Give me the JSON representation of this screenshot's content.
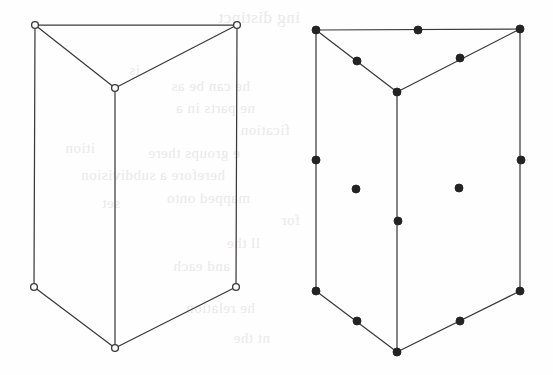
{
  "page": {
    "width": 553,
    "height": 375,
    "background_color": "#fefefe",
    "ink_color": "#3a3a3a",
    "bleedthrough_color": "#e9e7e6",
    "caption": ""
  },
  "figures": [
    {
      "id": "left-prism",
      "name": "triangular-prism-hollow-vertices",
      "marker_style": "hollow-circle",
      "marker_radius": 3.4,
      "marker_fill": "#fdfdfd",
      "marker_stroke": "#3a3a3a",
      "stroke_width": 1.25,
      "vertices": [
        {
          "label": "top-back-left",
          "x": 35,
          "y": 25
        },
        {
          "label": "top-back-right",
          "x": 237,
          "y": 25
        },
        {
          "label": "top-front",
          "x": 115,
          "y": 88
        },
        {
          "label": "bottom-back-left",
          "x": 34,
          "y": 287
        },
        {
          "label": "bottom-back-right",
          "x": 236,
          "y": 287
        },
        {
          "label": "bottom-front",
          "x": 115,
          "y": 348
        }
      ],
      "edges": [
        {
          "from": "top-back-left",
          "to": "top-back-right"
        },
        {
          "from": "top-back-left",
          "to": "top-front"
        },
        {
          "from": "top-back-right",
          "to": "top-front"
        },
        {
          "from": "top-back-left",
          "to": "bottom-back-left"
        },
        {
          "from": "top-back-right",
          "to": "bottom-back-right"
        },
        {
          "from": "top-front",
          "to": "bottom-front"
        },
        {
          "from": "bottom-back-left",
          "to": "bottom-front"
        },
        {
          "from": "bottom-back-right",
          "to": "bottom-front"
        }
      ],
      "markers": [
        {
          "kind": "vertex",
          "x": 35,
          "y": 25
        },
        {
          "kind": "vertex",
          "x": 237,
          "y": 25
        },
        {
          "kind": "vertex",
          "x": 115,
          "y": 88
        },
        {
          "kind": "vertex",
          "x": 34,
          "y": 287
        },
        {
          "kind": "vertex",
          "x": 236,
          "y": 287
        },
        {
          "kind": "vertex",
          "x": 115,
          "y": 348
        }
      ]
    },
    {
      "id": "right-prism",
      "name": "triangular-prism-filled-dots",
      "marker_style": "filled-disc",
      "marker_radius": 4.0,
      "marker_fill": "#232323",
      "marker_stroke": "#232323",
      "stroke_width": 1.25,
      "vertices": [
        {
          "label": "top-back-left",
          "x": 316,
          "y": 30
        },
        {
          "label": "top-back-right",
          "x": 520,
          "y": 29
        },
        {
          "label": "top-front",
          "x": 397,
          "y": 92
        },
        {
          "label": "bottom-back-left",
          "x": 316,
          "y": 291
        },
        {
          "label": "bottom-back-right",
          "x": 520,
          "y": 291
        },
        {
          "label": "bottom-front",
          "x": 397,
          "y": 352
        }
      ],
      "edges": [
        {
          "from": "top-back-left",
          "to": "top-back-right"
        },
        {
          "from": "top-back-left",
          "to": "top-front"
        },
        {
          "from": "top-back-right",
          "to": "top-front"
        },
        {
          "from": "top-back-left",
          "to": "bottom-back-left"
        },
        {
          "from": "top-back-right",
          "to": "bottom-back-right"
        },
        {
          "from": "top-front",
          "to": "bottom-front"
        },
        {
          "from": "bottom-back-left",
          "to": "bottom-front"
        },
        {
          "from": "bottom-back-right",
          "to": "bottom-front"
        }
      ],
      "markers": [
        {
          "kind": "vertex",
          "x": 316,
          "y": 30
        },
        {
          "kind": "vertex",
          "x": 520,
          "y": 29
        },
        {
          "kind": "vertex",
          "x": 397,
          "y": 92
        },
        {
          "kind": "vertex",
          "x": 316,
          "y": 291
        },
        {
          "kind": "vertex",
          "x": 520,
          "y": 291
        },
        {
          "kind": "vertex",
          "x": 397,
          "y": 352
        },
        {
          "kind": "edge-midpoint",
          "x": 418,
          "y": 30
        },
        {
          "kind": "edge-midpoint",
          "x": 357,
          "y": 61
        },
        {
          "kind": "edge-midpoint",
          "x": 460,
          "y": 58
        },
        {
          "kind": "edge-midpoint",
          "x": 316,
          "y": 160
        },
        {
          "kind": "edge-midpoint",
          "x": 521,
          "y": 160
        },
        {
          "kind": "edge-midpoint",
          "x": 398,
          "y": 221
        },
        {
          "kind": "edge-midpoint",
          "x": 357,
          "y": 321
        },
        {
          "kind": "edge-midpoint",
          "x": 460,
          "y": 321
        },
        {
          "kind": "face-center",
          "x": 356,
          "y": 189
        },
        {
          "kind": "face-center",
          "x": 459,
          "y": 188
        }
      ]
    }
  ],
  "bleedthrough_text": [
    {
      "text": "ing distinct",
      "x": 300,
      "y": 8,
      "size": 17
    },
    {
      "text": "he can be as",
      "x": 250,
      "y": 78,
      "size": 15
    },
    {
      "text": "ne parts in a",
      "x": 255,
      "y": 100,
      "size": 15
    },
    {
      "text": "fication",
      "x": 290,
      "y": 122,
      "size": 15
    },
    {
      "text": "e groups there",
      "x": 240,
      "y": 145,
      "size": 15
    },
    {
      "text": "herefore a subdivision",
      "x": 225,
      "y": 167,
      "size": 15
    },
    {
      "text": "mapped onto",
      "x": 250,
      "y": 190,
      "size": 15
    },
    {
      "text": "for",
      "x": 300,
      "y": 212,
      "size": 15
    },
    {
      "text": "ll the",
      "x": 260,
      "y": 235,
      "size": 15
    },
    {
      "text": "and each",
      "x": 230,
      "y": 258,
      "size": 15
    },
    {
      "text": "he relation",
      "x": 255,
      "y": 300,
      "size": 15
    },
    {
      "text": "nt the",
      "x": 270,
      "y": 330,
      "size": 15
    },
    {
      "text": "is",
      "x": 140,
      "y": 62,
      "size": 15
    },
    {
      "text": "ition",
      "x": 95,
      "y": 140,
      "size": 15
    },
    {
      "text": "set",
      "x": 120,
      "y": 195,
      "size": 15
    }
  ]
}
